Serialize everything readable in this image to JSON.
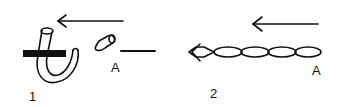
{
  "figures": [
    {
      "number": "1",
      "label": "A",
      "description": "hooked tube piercing bar with detached segment A, arrow pointing left"
    },
    {
      "number": "2",
      "label": "A",
      "description": "chain of segments ending in arrowhead, arrow pointing left"
    }
  ],
  "colors": {
    "ink": "#111111",
    "background": "#ffffff"
  }
}
